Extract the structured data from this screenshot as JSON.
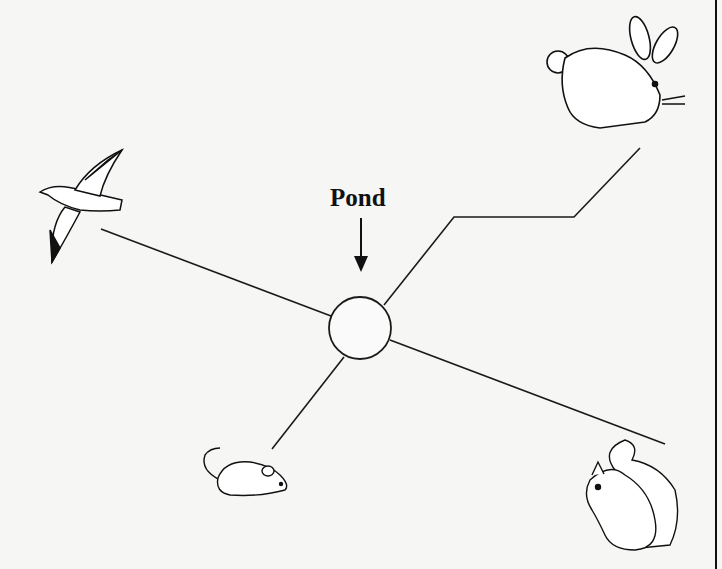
{
  "diagram": {
    "center": {
      "label": "Pond",
      "shape": "circle"
    },
    "nodes": [
      {
        "name": "bird",
        "icon": "bird-icon",
        "position": "left"
      },
      {
        "name": "rabbit",
        "icon": "rabbit-icon",
        "position": "top-right"
      },
      {
        "name": "mouse",
        "icon": "mouse-icon",
        "position": "bottom-left"
      },
      {
        "name": "squirrel",
        "icon": "squirrel-icon",
        "position": "bottom-right"
      }
    ],
    "colors": {
      "line": "#1a1a1a",
      "background": "#f6f6f4"
    }
  }
}
